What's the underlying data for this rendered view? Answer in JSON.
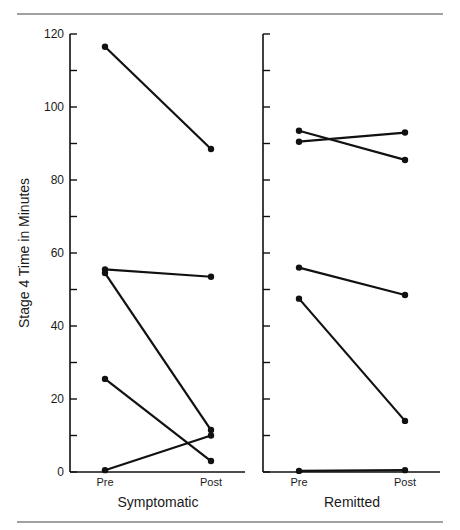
{
  "chart_data": [
    {
      "type": "line",
      "title": "",
      "panel_label": "Symptomatic",
      "xlabel": "Symptomatic",
      "ylabel": "Stage 4 Time in Minutes",
      "categories": [
        "Pre",
        "Post"
      ],
      "ylim": [
        0,
        120
      ],
      "yticks": [
        0,
        20,
        40,
        60,
        80,
        100,
        120
      ],
      "minor_tick_step": 10,
      "grid": false,
      "series": [
        {
          "name": "S1",
          "values": [
            116.5,
            88.5
          ]
        },
        {
          "name": "S2",
          "values": [
            55.5,
            53.5
          ]
        },
        {
          "name": "S3",
          "values": [
            54.5,
            11.5
          ]
        },
        {
          "name": "S4",
          "values": [
            25.5,
            3
          ]
        },
        {
          "name": "S5",
          "values": [
            0.5,
            10
          ]
        }
      ]
    },
    {
      "type": "line",
      "title": "",
      "panel_label": "Remitted",
      "xlabel": "Remitted",
      "ylabel": "",
      "categories": [
        "Pre",
        "Post"
      ],
      "ylim": [
        0,
        120
      ],
      "yticks": [],
      "minor_tick_step": 10,
      "grid": false,
      "series": [
        {
          "name": "R1",
          "values": [
            93.5,
            85.5
          ]
        },
        {
          "name": "R2",
          "values": [
            90.5,
            93
          ]
        },
        {
          "name": "R3",
          "values": [
            56,
            48.5
          ]
        },
        {
          "name": "R4",
          "values": [
            47.5,
            14
          ]
        },
        {
          "name": "R5",
          "values": [
            0.3,
            0.5
          ]
        }
      ]
    }
  ],
  "labels": {
    "ylabel": "Stage 4 Time in Minutes",
    "left_xlabel": "Symptomatic",
    "right_xlabel": "Remitted",
    "pre": "Pre",
    "post": "Post",
    "ytick_labels": [
      "0",
      "20",
      "40",
      "60",
      "80",
      "100",
      "120"
    ]
  }
}
